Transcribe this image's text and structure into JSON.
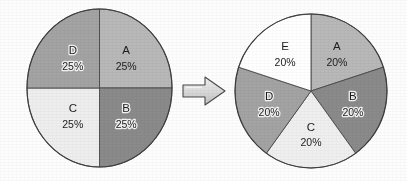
{
  "figure": {
    "description": "A four-segment pie chart with equal 25% slices transforms into a five-segment pie chart with equal 20% slices.",
    "background_color": "#fdfdfd",
    "outline_color": "#3d3d3d",
    "arrow": {
      "name": "right-arrow",
      "direction": "right",
      "fill_color": "#d9d9d9",
      "outline_color": "#4a4a4a"
    }
  },
  "chart_data": [
    {
      "type": "pie",
      "id": "pie-left",
      "title": "",
      "legend_position": "none",
      "start_angle_deg": 0,
      "direction": "clockwise",
      "categories": [
        "A",
        "B",
        "C",
        "D"
      ],
      "values": [
        25,
        25,
        25,
        25
      ],
      "value_labels": [
        "25%",
        "25%",
        "25%",
        "25%"
      ],
      "colors": [
        "#b8b8b8",
        "#8a8a8a",
        "#eeeeee",
        "#a3a3a3"
      ],
      "label_styles": [
        "plain",
        "halo",
        "plain",
        "halo"
      ],
      "slices": [
        {
          "name": "A",
          "value": 25,
          "value_label": "25%",
          "color": "#b8b8b8",
          "label_style": "plain"
        },
        {
          "name": "B",
          "value": 25,
          "value_label": "25%",
          "color": "#8a8a8a",
          "label_style": "halo"
        },
        {
          "name": "C",
          "value": 25,
          "value_label": "25%",
          "color": "#eeeeee",
          "label_style": "plain"
        },
        {
          "name": "D",
          "value": 25,
          "value_label": "25%",
          "color": "#a3a3a3",
          "label_style": "halo"
        }
      ]
    },
    {
      "type": "pie",
      "id": "pie-right",
      "title": "",
      "legend_position": "none",
      "start_angle_deg": 0,
      "direction": "clockwise",
      "categories": [
        "A",
        "B",
        "C",
        "D",
        "E"
      ],
      "values": [
        20,
        20,
        20,
        20,
        20
      ],
      "value_labels": [
        "20%",
        "20%",
        "20%",
        "20%",
        "20%"
      ],
      "colors": [
        "#b8b8b8",
        "#8a8a8a",
        "#efefef",
        "#a3a3a3",
        "#ffffff"
      ],
      "label_styles": [
        "plain",
        "halo",
        "plain",
        "halo",
        "plain"
      ],
      "slices": [
        {
          "name": "A",
          "value": 20,
          "value_label": "20%",
          "color": "#b8b8b8",
          "label_style": "plain"
        },
        {
          "name": "B",
          "value": 20,
          "value_label": "20%",
          "color": "#8a8a8a",
          "label_style": "halo"
        },
        {
          "name": "C",
          "value": 20,
          "value_label": "20%",
          "color": "#efefef",
          "label_style": "plain"
        },
        {
          "name": "D",
          "value": 20,
          "value_label": "20%",
          "color": "#a3a3a3",
          "label_style": "halo"
        },
        {
          "name": "E",
          "value": 20,
          "value_label": "20%",
          "color": "#ffffff",
          "label_style": "plain"
        }
      ]
    }
  ]
}
